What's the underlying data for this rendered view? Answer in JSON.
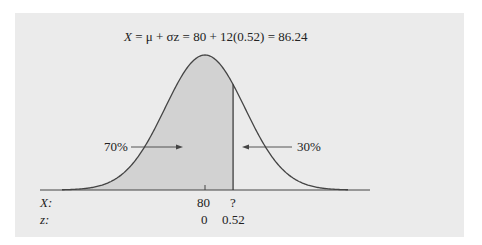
{
  "equation": {
    "lhs": "X",
    "text": " = μ + σz = 80 + 12(0.52) = 86.24",
    "full": "X = μ + σz = 80 + 12(0.52) = 86.24"
  },
  "areas": {
    "left_label": "70%",
    "right_label": "30%"
  },
  "axis": {
    "x_row_label": "X:",
    "z_row_label": "z:",
    "x_values": [
      "80",
      "?"
    ],
    "z_values": [
      "0",
      "0.52"
    ]
  },
  "colors": {
    "panel_bg": "#ebebeb",
    "shade": "#d2d2d2",
    "curve": "#444444"
  },
  "chart_data": {
    "type": "area",
    "title": "X = μ + σz = 80 + 12(0.52) = 86.24",
    "distribution": "normal",
    "mean": 80,
    "sd": 12,
    "z_cutoff": 0.52,
    "x_cutoff": 86.24,
    "shaded_region": "left of z = 0.52",
    "shaded_percent": 70,
    "unshaded_percent": 30,
    "tick_labels_x": [
      "80",
      "?"
    ],
    "tick_labels_z": [
      "0",
      "0.52"
    ],
    "annotations": [
      "70%",
      "30%"
    ]
  }
}
